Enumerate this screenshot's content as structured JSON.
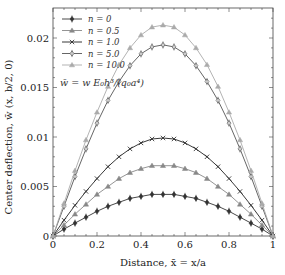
{
  "chart_data": {
    "type": "line",
    "title": "",
    "xlabel": "Distance, x̄ = x/a",
    "ylabel": "Center deflection, w̄ (x, b/2, 0)",
    "xlim": [
      0,
      1
    ],
    "ylim": [
      0,
      0.023
    ],
    "xticks": [
      0,
      0.2,
      0.4,
      0.6,
      0.8,
      1
    ],
    "xtick_labels": [
      "0",
      "0.2",
      "0.4",
      "0.6",
      "0.8",
      "1"
    ],
    "yticks": [
      0,
      0.005,
      0.01,
      0.015,
      0.02
    ],
    "ytick_labels": [
      "0",
      "0.005",
      "0.01",
      "0.015",
      "0.02"
    ],
    "grid": false,
    "legend_position": "upper left",
    "annotation": "w̄ = w E₀h³ / (q₀a⁴)",
    "x": [
      0,
      0.05,
      0.1,
      0.15,
      0.2,
      0.25,
      0.3,
      0.35,
      0.4,
      0.45,
      0.5,
      0.55,
      0.6,
      0.65,
      0.7,
      0.75,
      0.8,
      0.85,
      0.9,
      0.95,
      1
    ],
    "series": [
      {
        "name": "n = 0",
        "marker": "diamond-filled",
        "color": "#333333",
        "values": [
          0,
          0.0007,
          0.0013,
          0.0019,
          0.0025,
          0.003,
          0.0034,
          0.0038,
          0.004,
          0.0042,
          0.0042,
          0.0042,
          0.004,
          0.0038,
          0.0034,
          0.003,
          0.0025,
          0.0019,
          0.0013,
          0.0007,
          0
        ]
      },
      {
        "name": "n = 0.5",
        "marker": "triangle",
        "color": "#888888",
        "values": [
          0,
          0.0011,
          0.0022,
          0.0032,
          0.0042,
          0.005,
          0.0058,
          0.0064,
          0.0068,
          0.0071,
          0.0071,
          0.0071,
          0.0068,
          0.0064,
          0.0058,
          0.005,
          0.0042,
          0.0032,
          0.0022,
          0.0011,
          0
        ]
      },
      {
        "name": "n = 1.0",
        "marker": "cross",
        "color": "#222222",
        "values": [
          0,
          0.0016,
          0.0031,
          0.0045,
          0.0058,
          0.007,
          0.008,
          0.0088,
          0.0094,
          0.0098,
          0.0099,
          0.0098,
          0.0094,
          0.0088,
          0.008,
          0.007,
          0.0058,
          0.0045,
          0.0031,
          0.0016,
          0
        ]
      },
      {
        "name": "n = 5.0",
        "marker": "diamond-open",
        "color": "#555555",
        "values": [
          0,
          0.003,
          0.006,
          0.0088,
          0.0114,
          0.0137,
          0.0156,
          0.0172,
          0.0184,
          0.0191,
          0.0193,
          0.0191,
          0.0184,
          0.0172,
          0.0156,
          0.0137,
          0.0114,
          0.0088,
          0.006,
          0.003,
          0
        ]
      },
      {
        "name": "n = 10.0",
        "marker": "triangle",
        "color": "#aaaaaa",
        "values": [
          0,
          0.0033,
          0.0066,
          0.0097,
          0.0125,
          0.0151,
          0.0173,
          0.019,
          0.0203,
          0.0211,
          0.0213,
          0.0211,
          0.0203,
          0.019,
          0.0173,
          0.0151,
          0.0125,
          0.0097,
          0.0066,
          0.0033,
          0
        ]
      }
    ]
  },
  "labels": {
    "xlabel": "Distance, x̄ = x/a",
    "ylabel": "Center deflection, w̄ (x, b/2, 0)",
    "formula": "w̄ = w E₀h³/(q₀a⁴)"
  }
}
